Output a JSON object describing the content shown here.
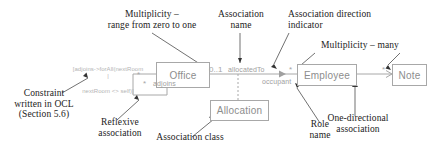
{
  "figure": {
    "kind": "uml-class-diagram-annotated",
    "colors": {
      "diagram_line": "#a8a8a8",
      "diagram_text": "#8d8d8d",
      "diagram_label": "#a0a0a0",
      "annotation_text": "#222222",
      "background": "#ffffff"
    }
  },
  "classes": [
    {
      "id": "office",
      "name": "Office"
    },
    {
      "id": "allocation",
      "name": "Allocation"
    },
    {
      "id": "employee",
      "name": "Employee"
    },
    {
      "id": "note",
      "name": "Note"
    }
  ],
  "diagram_labels": {
    "association_name": "allocatedTo",
    "role_name": "occupant",
    "reflexive_name": "adjoins",
    "multiplicity_office": "0..1",
    "multiplicity_employee": "*",
    "multiplicity_note": "*",
    "multiplicity_reflexive_a": "*",
    "multiplicity_reflexive_b": "*"
  },
  "constraint": {
    "line1": "[adjoins->forAll(nextRoom |",
    "line2": "nextRoom <> self)]"
  },
  "annotations": [
    {
      "id": "multiplicity-zero-to-one",
      "text": "Multiplicity –\nrange from zero to one"
    },
    {
      "id": "association-name",
      "text": "Association\nname"
    },
    {
      "id": "association-direction-indicator",
      "text": "Association direction\nindicator"
    },
    {
      "id": "multiplicity-many",
      "text": "Multiplicity – many"
    },
    {
      "id": "constraint-ocl",
      "text": "Constraint\nwritten in OCL\n(Section 5.6)"
    },
    {
      "id": "reflexive-association",
      "text": "Reflexive\nassociation"
    },
    {
      "id": "association-class",
      "text": "Association class"
    },
    {
      "id": "role-name",
      "text": "Role\nname"
    },
    {
      "id": "one-directional-association",
      "text": "One-directional\nassociation"
    }
  ]
}
